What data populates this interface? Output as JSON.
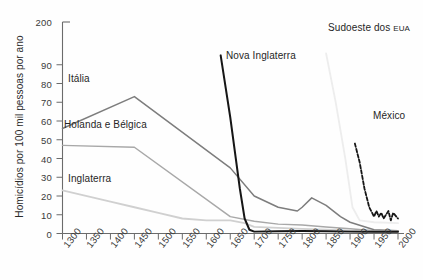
{
  "chart_data": {
    "type": "line",
    "title": "",
    "xlabel": "",
    "ylabel": "Homicídios por 100 mil pessoas por ano",
    "xlim": [
      1300,
      2000
    ],
    "ylim": [
      0,
      100
    ],
    "y_axis_note": "eixo quebrado: rótulo superior 200 acima de 90",
    "yticks": [
      "200",
      "90",
      "80",
      "70",
      "60",
      "50",
      "40",
      "30",
      "20",
      "10",
      "0"
    ],
    "xticks": [
      "1300",
      "1350",
      "1400",
      "1450",
      "1500",
      "1550",
      "1600",
      "1650",
      "1700",
      "1750",
      "1800",
      "1850",
      "1900",
      "1950",
      "2000"
    ],
    "grid": false,
    "legend_position": "inline-annotations",
    "series": [
      {
        "name": "Itália",
        "color": "#7d7d7d",
        "style": "solid",
        "points": [
          [
            1300,
            56
          ],
          [
            1450,
            73
          ],
          [
            1650,
            35
          ],
          [
            1700,
            20
          ],
          [
            1750,
            14
          ],
          [
            1790,
            12
          ],
          [
            1800,
            14
          ],
          [
            1820,
            19
          ],
          [
            1850,
            15
          ],
          [
            1880,
            9
          ],
          [
            1900,
            6
          ],
          [
            1950,
            2
          ],
          [
            2000,
            1.5
          ]
        ]
      },
      {
        "name": "Holanda e Bélgica",
        "color": "#a8a8a8",
        "style": "solid",
        "points": [
          [
            1300,
            47
          ],
          [
            1450,
            46
          ],
          [
            1650,
            9
          ],
          [
            1700,
            6.5
          ],
          [
            1750,
            5
          ],
          [
            1800,
            4.5
          ],
          [
            1850,
            3.5
          ],
          [
            1900,
            2.5
          ],
          [
            1950,
            1.5
          ],
          [
            2000,
            1.3
          ]
        ]
      },
      {
        "name": "Inglaterra",
        "color": "#d0d0d0",
        "style": "solid",
        "points": [
          [
            1300,
            23
          ],
          [
            1400,
            17
          ],
          [
            1450,
            14
          ],
          [
            1500,
            11
          ],
          [
            1550,
            8
          ],
          [
            1600,
            7
          ],
          [
            1650,
            7
          ],
          [
            1680,
            5.5
          ],
          [
            1700,
            3.5
          ],
          [
            1750,
            3
          ],
          [
            1800,
            2.5
          ],
          [
            1850,
            2
          ],
          [
            1900,
            1.5
          ],
          [
            1950,
            1
          ],
          [
            2000,
            1
          ]
        ]
      },
      {
        "name": "Nova Inglaterra",
        "color": "#161616",
        "style": "solid",
        "points": [
          [
            1630,
            95
          ],
          [
            1650,
            62
          ],
          [
            1670,
            24
          ],
          [
            1680,
            8
          ],
          [
            1690,
            2
          ],
          [
            1700,
            1
          ],
          [
            1750,
            1.2
          ],
          [
            1800,
            1.3
          ],
          [
            1850,
            1.2
          ],
          [
            1900,
            1
          ],
          [
            1950,
            1
          ],
          [
            2000,
            1
          ]
        ]
      },
      {
        "name": "Sudoeste dos EUA",
        "color": "#ededed",
        "style": "solid",
        "points": [
          [
            1850,
            96
          ],
          [
            1870,
            70
          ],
          [
            1890,
            40
          ],
          [
            1905,
            14
          ],
          [
            1920,
            7
          ],
          [
            1950,
            6
          ],
          [
            2000,
            5.5
          ]
        ]
      },
      {
        "name": "México",
        "color": "#161616",
        "style": "dashed",
        "points": [
          [
            1910,
            48
          ],
          [
            1920,
            38
          ],
          [
            1930,
            24
          ],
          [
            1940,
            14
          ],
          [
            1950,
            9
          ],
          [
            1955,
            12
          ],
          [
            1960,
            9
          ],
          [
            1965,
            11
          ],
          [
            1970,
            8
          ],
          [
            1980,
            12
          ],
          [
            1985,
            7
          ],
          [
            1990,
            11
          ],
          [
            2000,
            8
          ]
        ]
      }
    ],
    "annotations": [
      {
        "text": "Itália",
        "x": 1400,
        "y": 70
      },
      {
        "text": "Holanda e Bélgica",
        "x": 1330,
        "y": 52
      },
      {
        "text": "Inglaterra",
        "x": 1360,
        "y": 26
      },
      {
        "text": "Nova Inglaterra",
        "x": 1665,
        "y": 88
      },
      {
        "text": "Sudoeste dos EUA",
        "x": 1880,
        "y": 100
      },
      {
        "text": "México",
        "x": 1955,
        "y": 58
      }
    ]
  },
  "labels": {
    "ylabel": "Homicídios por 100 mil pessoas por ano",
    "italia": "Itália",
    "holanda": "Holanda e Bélgica",
    "inglaterra": "Inglaterra",
    "nova_inglaterra": "Nova Inglaterra",
    "sudoeste_main": "Sudoeste dos ",
    "sudoeste_abbrev": "EUA",
    "mexico": "México"
  }
}
